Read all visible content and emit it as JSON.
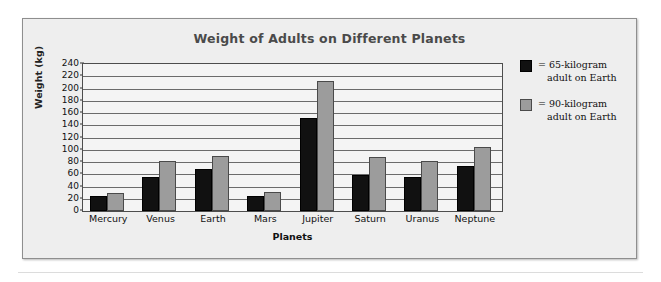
{
  "chart_data": {
    "type": "bar",
    "title": "Weight of Adults on Different Planets",
    "xlabel": "Planets",
    "ylabel": "Weight (kg)",
    "categories": [
      "Mercury",
      "Venus",
      "Earth",
      "Mars",
      "Jupiter",
      "Saturn",
      "Uranus",
      "Neptune"
    ],
    "series": [
      {
        "name": "= 65-kilogram adult on Earth",
        "legend_line1": "= 65-kilogram",
        "legend_line2": "adult on Earth",
        "color": "#111111",
        "values": [
          25,
          55,
          68,
          25,
          152,
          59,
          56,
          73
        ]
      },
      {
        "name": "= 90-kilogram adult on Earth",
        "legend_line1": "= 90-kilogram",
        "legend_line2": "adult on Earth",
        "color": "#9c9c9c",
        "values": [
          30,
          82,
          90,
          31,
          213,
          88,
          82,
          105
        ]
      }
    ],
    "ylim": [
      0,
      240
    ],
    "ytick_step": 20,
    "yticks": [
      0,
      20,
      40,
      60,
      80,
      100,
      120,
      140,
      160,
      180,
      200,
      220,
      240
    ],
    "ytick_labels": [
      "0",
      "20",
      "40",
      "60",
      "80",
      "100",
      "120",
      "140",
      "160",
      "180",
      "200",
      "220",
      "240"
    ],
    "grid": true,
    "legend_position": "right"
  }
}
